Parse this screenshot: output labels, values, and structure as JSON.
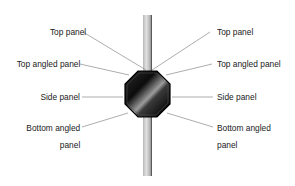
{
  "diagram": {
    "component": "octagonal fixture on pole",
    "left_labels": [
      {
        "text": "Top panel"
      },
      {
        "text": "Top angled panel"
      },
      {
        "text": "Side panel"
      },
      {
        "text": "Bottom angled"
      },
      {
        "text": "panel"
      }
    ],
    "right_labels": [
      {
        "text": "Top panel"
      },
      {
        "text": "Top angled panel"
      },
      {
        "text": "Side panel"
      },
      {
        "text": "Bottom angled"
      },
      {
        "text": "panel"
      }
    ],
    "colors": {
      "leader_line": "#8a8a8a",
      "pole": "#c9c9c9",
      "octagon_dark": "#111111",
      "octagon_highlight": "#9a9a9a"
    }
  }
}
